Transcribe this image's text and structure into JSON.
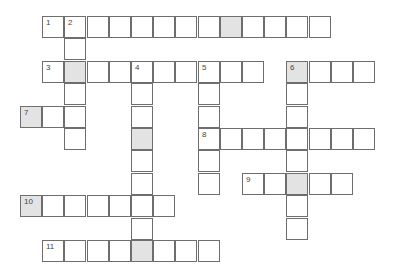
{
  "puzzle": {
    "type": "crossword",
    "layout": {
      "origin_x": 20,
      "origin_y": 16,
      "col_pitch": 22.2,
      "row_pitch": 22.4
    },
    "colors": {
      "border": "#6e6e6e",
      "shaded": "#e3e3e3",
      "cell": "#ffffff"
    },
    "clues": [
      {
        "number": "1",
        "direction": "across",
        "row": 0,
        "col": 1,
        "length": 13
      },
      {
        "number": "2",
        "direction": "down",
        "row": 0,
        "col": 2,
        "length": 6
      },
      {
        "number": "3",
        "direction": "across",
        "row": 2,
        "col": 1,
        "length": 10
      },
      {
        "number": "4",
        "direction": "down",
        "row": 2,
        "col": 5,
        "length": 9
      },
      {
        "number": "5",
        "direction": "down",
        "row": 2,
        "col": 8,
        "length": 6
      },
      {
        "number": "6",
        "direction": "across",
        "row": 2,
        "col": 12,
        "length": 4
      },
      {
        "number": "6",
        "direction": "down",
        "row": 2,
        "col": 12,
        "length": 8
      },
      {
        "number": "7",
        "direction": "across",
        "row": 4,
        "col": 0,
        "length": 3
      },
      {
        "number": "8",
        "direction": "across",
        "row": 5,
        "col": 8,
        "length": 8
      },
      {
        "number": "9",
        "direction": "across",
        "row": 7,
        "col": 10,
        "length": 5
      },
      {
        "number": "10",
        "direction": "across",
        "row": 8,
        "col": 0,
        "length": 7
      },
      {
        "number": "11",
        "direction": "across",
        "row": 10,
        "col": 1,
        "length": 8
      }
    ],
    "shaded_cells": [
      [
        0,
        9
      ],
      [
        2,
        2
      ],
      [
        2,
        12
      ],
      [
        4,
        0
      ],
      [
        5,
        5
      ],
      [
        7,
        12
      ],
      [
        8,
        0
      ],
      [
        10,
        5
      ]
    ],
    "numbered_cells": [
      {
        "row": 0,
        "col": 1,
        "label": "1"
      },
      {
        "row": 0,
        "col": 2,
        "label": "2"
      },
      {
        "row": 2,
        "col": 1,
        "label": "3"
      },
      {
        "row": 2,
        "col": 5,
        "label": "4"
      },
      {
        "row": 2,
        "col": 8,
        "label": "5"
      },
      {
        "row": 2,
        "col": 12,
        "label": "6"
      },
      {
        "row": 4,
        "col": 0,
        "label": "7"
      },
      {
        "row": 5,
        "col": 8,
        "label": "8"
      },
      {
        "row": 7,
        "col": 10,
        "label": "9"
      },
      {
        "row": 8,
        "col": 0,
        "label": "10"
      },
      {
        "row": 10,
        "col": 1,
        "label": "11"
      }
    ]
  }
}
